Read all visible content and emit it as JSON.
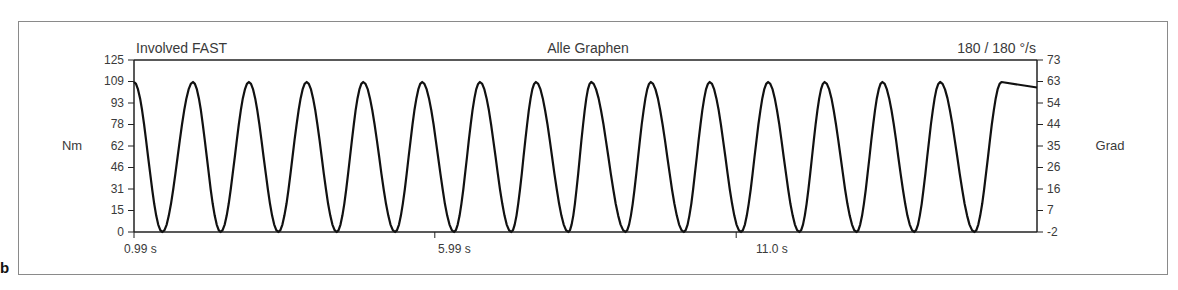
{
  "panel_letter": "b",
  "header": {
    "left_title": "Involved FAST",
    "center_title": "Alle Graphen",
    "right_title": "180 / 180  °/s"
  },
  "axes": {
    "left_label": "Nm",
    "right_label": "Grad",
    "left_ticks": [
      "125",
      "109",
      "93",
      "78",
      "62",
      "46",
      "31",
      "15",
      "0"
    ],
    "right_ticks": [
      "73",
      "63",
      "54",
      "44",
      "35",
      "26",
      "16",
      "7",
      "-2"
    ],
    "x_ticks": [
      "0.99 s",
      "5.99 s",
      "11.0 s"
    ]
  },
  "colors": {
    "curve": "#111111",
    "axis": "#222222",
    "frame": "#8a8a8a",
    "text": "#3a3a3a"
  },
  "chart_data": {
    "type": "line",
    "title": "Alle Graphen",
    "subtitle_left": "Involved FAST",
    "subtitle_right": "180 / 180 °/s",
    "xlabel": "s",
    "ylabel": "Nm",
    "ylabel_right": "Grad",
    "xlim": [
      0.99,
      16.0
    ],
    "ylim": [
      0,
      125
    ],
    "ylim_right": [
      -2,
      73
    ],
    "x_tick_values": [
      0.99,
      5.99,
      11.0
    ],
    "y_tick_values": [
      0,
      15,
      31,
      46,
      62,
      78,
      93,
      109,
      125
    ],
    "y_right_tick_values": [
      -2,
      7,
      16,
      26,
      35,
      44,
      54,
      63,
      73
    ],
    "grid": false,
    "legend": "none",
    "series": [
      {
        "name": "Torque (Nm)",
        "description": "periodic torque curve oscillating between ~0 and ~109 Nm, period ~0.95 s, starting near peak",
        "peak_value": 109,
        "trough_value": 0,
        "period_s": 0.95,
        "peak_times_s": [
          1.97,
          2.9,
          3.86,
          4.8,
          5.78,
          6.74,
          7.67,
          8.59,
          9.58,
          10.56,
          11.53,
          12.47,
          13.43,
          14.39,
          15.41
        ],
        "trough_times_s": [
          1.46,
          2.43,
          3.39,
          4.36,
          5.33,
          6.31,
          7.26,
          8.21,
          9.16,
          10.13,
          11.08,
          12.05,
          13.0,
          13.96,
          14.96
        ]
      }
    ]
  }
}
